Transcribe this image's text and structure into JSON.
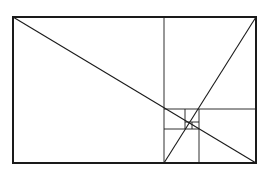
{
  "diagram": {
    "type": "golden-rectangle-subdivision",
    "stroke_color": "#1a1a1a",
    "background": "#ffffff",
    "outer_rect": {
      "x": 13,
      "y": 17,
      "w": 243,
      "h": 146,
      "stroke_width": 2
    },
    "subdivision_lines": [
      {
        "x1": 164,
        "y1": 17,
        "x2": 164,
        "y2": 163
      },
      {
        "x1": 164,
        "y1": 109,
        "x2": 256,
        "y2": 109
      },
      {
        "x1": 199,
        "y1": 109,
        "x2": 199,
        "y2": 163
      },
      {
        "x1": 164,
        "y1": 129,
        "x2": 199,
        "y2": 129
      },
      {
        "x1": 185,
        "y1": 109,
        "x2": 185,
        "y2": 129
      },
      {
        "x1": 185,
        "y1": 122,
        "x2": 199,
        "y2": 122
      },
      {
        "x1": 192,
        "y1": 122,
        "x2": 192,
        "y2": 129
      }
    ],
    "diagonals": [
      {
        "x1": 13,
        "y1": 17,
        "x2": 256,
        "y2": 163
      },
      {
        "x1": 164,
        "y1": 163,
        "x2": 256,
        "y2": 17
      }
    ]
  }
}
